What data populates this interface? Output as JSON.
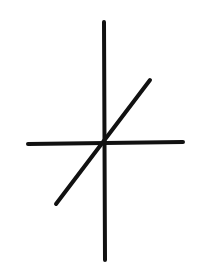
{
  "canvas": {
    "width": 212,
    "height": 278,
    "background": "#ffffff"
  },
  "symbol": {
    "stroke_color": "#111111",
    "stroke_width": 4,
    "lines": [
      {
        "name": "vertical-stroke",
        "x1": 104,
        "y1": 22,
        "x2": 105,
        "y2": 260
      },
      {
        "name": "horizontal-stroke",
        "x1": 28,
        "y1": 144,
        "x2": 183,
        "y2": 142
      },
      {
        "name": "diagonal-stroke",
        "x1": 150,
        "y1": 80,
        "x2": 56,
        "y2": 204
      }
    ]
  }
}
